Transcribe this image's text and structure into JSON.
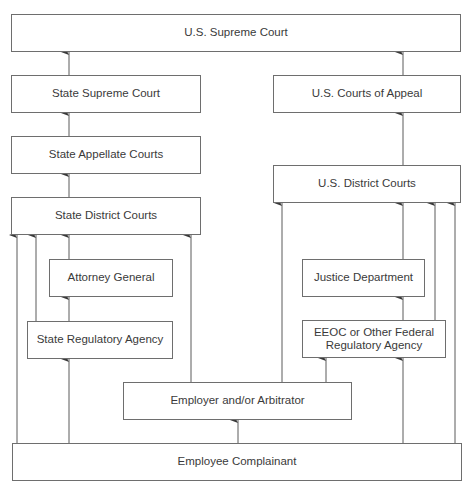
{
  "diagram": {
    "type": "flowchart",
    "title": "",
    "colors": {
      "line": "#5a5a5a",
      "border": "#6e6e6e",
      "text": "#3a3a3a",
      "background": "#ffffff"
    },
    "nodes": {
      "us_supreme_court": {
        "label": "U.S. Supreme Court"
      },
      "state_supreme_court": {
        "label": "State Supreme Court"
      },
      "state_appellate_courts": {
        "label": "State Appellate Courts"
      },
      "state_district_courts": {
        "label": "State District Courts"
      },
      "attorney_general": {
        "label": "Attorney General"
      },
      "state_regulatory_agency": {
        "label": "State Regulatory Agency"
      },
      "employer_arbitrator": {
        "label": "Employer and/or Arbitrator"
      },
      "employee_complainant": {
        "label": "Employee Complainant"
      },
      "us_courts_of_appeal": {
        "label": "U.S. Courts of Appeal"
      },
      "us_district_courts": {
        "label": "U.S. District Courts"
      },
      "justice_department": {
        "label": "Justice Department"
      },
      "eeoc": {
        "label": "EEOC or Other Federal\nRegulatory Agency"
      }
    },
    "edges": [
      {
        "from": "state_supreme_court",
        "to": "us_supreme_court"
      },
      {
        "from": "us_courts_of_appeal",
        "to": "us_supreme_court"
      },
      {
        "from": "state_appellate_courts",
        "to": "state_supreme_court"
      },
      {
        "from": "state_district_courts",
        "to": "state_appellate_courts"
      },
      {
        "from": "us_district_courts",
        "to": "us_courts_of_appeal"
      },
      {
        "from": "employee_complainant",
        "to": "state_district_courts"
      },
      {
        "from": "state_regulatory_agency",
        "to": "state_district_courts"
      },
      {
        "from": "attorney_general",
        "to": "state_district_courts"
      },
      {
        "from": "employer_arbitrator",
        "to": "state_district_courts"
      },
      {
        "from": "state_regulatory_agency",
        "to": "attorney_general"
      },
      {
        "from": "employee_complainant",
        "to": "state_regulatory_agency"
      },
      {
        "from": "employee_complainant",
        "to": "employer_arbitrator"
      },
      {
        "from": "employer_arbitrator",
        "to": "us_district_courts"
      },
      {
        "from": "justice_department",
        "to": "us_district_courts"
      },
      {
        "from": "eeoc",
        "to": "us_district_courts"
      },
      {
        "from": "employee_complainant",
        "to": "us_district_courts"
      },
      {
        "from": "eeoc",
        "to": "justice_department"
      },
      {
        "from": "employer_arbitrator",
        "to": "eeoc"
      },
      {
        "from": "employee_complainant",
        "to": "eeoc"
      }
    ]
  }
}
